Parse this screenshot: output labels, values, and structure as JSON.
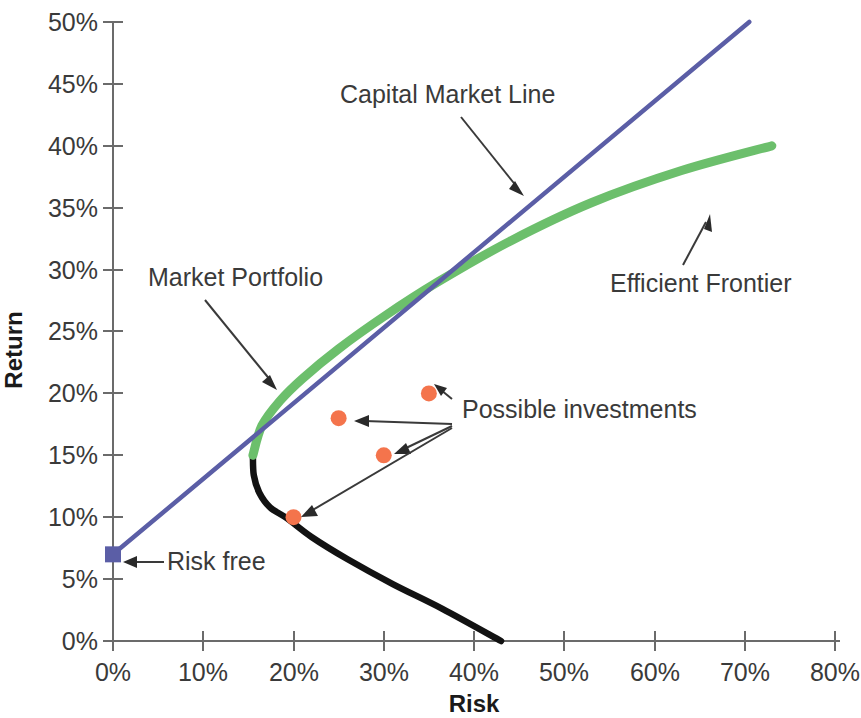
{
  "chart_data": {
    "type": "line",
    "title": "",
    "xlabel": "Risk",
    "ylabel": "Return",
    "xlim": [
      0,
      80
    ],
    "ylim": [
      0,
      50
    ],
    "grid": false,
    "legend": "none",
    "x_ticks": [
      "0%",
      "10%",
      "20%",
      "30%",
      "40%",
      "50%",
      "60%",
      "70%",
      "80%"
    ],
    "x_tick_values": [
      0,
      10,
      20,
      30,
      40,
      50,
      60,
      70,
      80
    ],
    "y_ticks": [
      "0%",
      "5%",
      "10%",
      "15%",
      "20%",
      "25%",
      "30%",
      "35%",
      "40%",
      "45%",
      "50%"
    ],
    "y_tick_values": [
      0,
      5,
      10,
      15,
      20,
      25,
      30,
      35,
      40,
      45,
      50
    ],
    "series": [
      {
        "name": "Capital Market Line",
        "type": "line",
        "color": "#5b5ea6",
        "points": [
          [
            0,
            7
          ],
          [
            70.5,
            50
          ]
        ]
      },
      {
        "name": "Efficient Frontier",
        "type": "curve",
        "color": "#6cbf6c",
        "points": [
          [
            15.5,
            15.0
          ],
          [
            16.5,
            17.4
          ],
          [
            18.5,
            19.4
          ],
          [
            21.0,
            21.2
          ],
          [
            25.0,
            23.6
          ],
          [
            30.0,
            26.2
          ],
          [
            36.0,
            29.0
          ],
          [
            44.0,
            32.3
          ],
          [
            53.0,
            35.4
          ],
          [
            63.0,
            38.0
          ],
          [
            73.0,
            40.0
          ]
        ]
      },
      {
        "name": "Inefficient Frontier",
        "type": "curve",
        "color": "#121212",
        "points": [
          [
            15.5,
            15.0
          ],
          [
            15.6,
            13.4
          ],
          [
            16.2,
            12.0
          ],
          [
            17.4,
            10.8
          ],
          [
            19.3,
            9.9
          ],
          [
            22.0,
            8.4
          ],
          [
            26.0,
            6.6
          ],
          [
            31.0,
            4.6
          ],
          [
            36.5,
            2.6
          ],
          [
            43.0,
            0.0
          ]
        ]
      },
      {
        "name": "Possible investments",
        "type": "scatter",
        "color": "#f4744c",
        "points": [
          [
            25,
            18
          ],
          [
            35,
            20
          ],
          [
            30,
            15
          ],
          [
            20,
            10
          ]
        ]
      },
      {
        "name": "Risk free",
        "type": "marker",
        "color": "#5b5ea6",
        "points": [
          [
            0,
            7
          ]
        ]
      }
    ],
    "annotations": [
      {
        "id": "capital-market-line",
        "text": "Capital Market Line",
        "text_x": 340,
        "text_y": 103,
        "arrow_from_x": 461,
        "arrow_from_y": 117,
        "arrow_to_x": 524,
        "arrow_to_y": 196
      },
      {
        "id": "efficient-frontier",
        "text": "Efficient Frontier",
        "text_x": 610,
        "text_y": 292,
        "arrow_from_x": 683,
        "arrow_from_y": 265,
        "arrow_to_x": 710,
        "arrow_to_y": 214
      },
      {
        "id": "market-portfolio",
        "text": "Market Portfolio",
        "text_x": 148,
        "text_y": 286,
        "arrow_from_x": 205,
        "arrow_from_y": 300,
        "arrow_to_x": 277,
        "arrow_to_y": 390
      },
      {
        "id": "possible-investments",
        "text": "Possible investments",
        "text_x": 462,
        "text_y": 418,
        "arrow_from_x": 452,
        "arrow_from_y": 424,
        "arrow_to_x": 355,
        "arrow_to_y": 420
      },
      {
        "id": "risk-free",
        "text": "Risk free",
        "text_x": 167,
        "text_y": 570,
        "arrow_from_x": 164,
        "arrow_from_y": 562,
        "arrow_to_x": 126,
        "arrow_to_y": 562
      }
    ]
  }
}
